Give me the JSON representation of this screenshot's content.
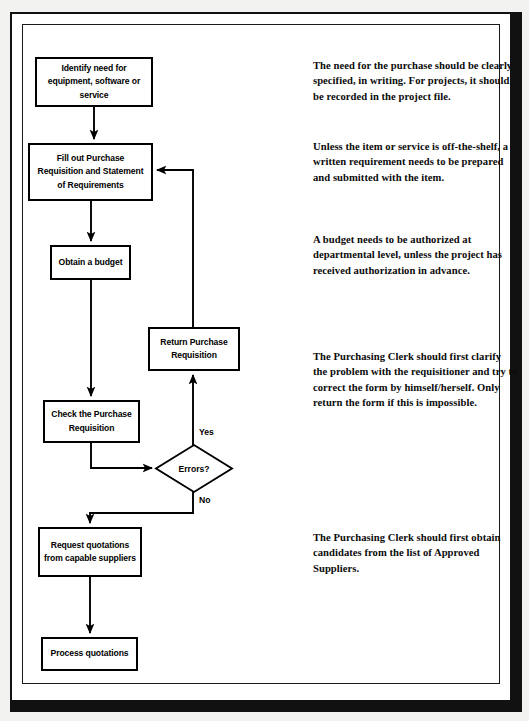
{
  "document": {
    "title": "Purchasing Process Flowchart",
    "frame_color": "#111111",
    "page_color": "#ffffff",
    "ink_color": "#000000"
  },
  "flowchart": {
    "type": "process-flow",
    "nodes": [
      {
        "id": "identify-need",
        "shape": "process",
        "label": "Identify need for equipment, software or service",
        "x": 35,
        "y": 57,
        "w": 118,
        "h": 50
      },
      {
        "id": "fill-out-requisition",
        "shape": "process",
        "label": "Fill out Purchase Requisition and Statement of Requirements",
        "x": 28,
        "y": 143,
        "w": 125,
        "h": 58
      },
      {
        "id": "obtain-budget",
        "shape": "process",
        "label": "Obtain a budget",
        "x": 50,
        "y": 245,
        "w": 81,
        "h": 35
      },
      {
        "id": "return-requisition",
        "shape": "process",
        "label": "Return Purchase Requisition",
        "x": 148,
        "y": 327,
        "w": 92,
        "h": 44
      },
      {
        "id": "check-requisition",
        "shape": "process",
        "label": "Check the Purchase Requisition",
        "x": 43,
        "y": 400,
        "w": 97,
        "h": 43
      },
      {
        "id": "errors-decision",
        "shape": "decision",
        "label": "Errors?",
        "x": 156,
        "y": 445,
        "w": 76,
        "h": 47
      },
      {
        "id": "request-quotations",
        "shape": "process",
        "label": "Request quotations from capable suppliers",
        "x": 38,
        "y": 527,
        "w": 104,
        "h": 50
      },
      {
        "id": "process-quotations",
        "shape": "process",
        "label": "Process quotations",
        "x": 41,
        "y": 637,
        "w": 97,
        "h": 34
      }
    ],
    "branch_labels": [
      {
        "id": "yes-label",
        "text": "Yes",
        "x": 199,
        "y": 427
      },
      {
        "id": "no-label",
        "text": "No",
        "x": 199,
        "y": 495
      }
    ],
    "edges": [
      {
        "id": "edge-identify-to-fill",
        "from": "identify-need",
        "to": "fill-out-requisition",
        "label": ""
      },
      {
        "id": "edge-fill-to-budget",
        "from": "fill-out-requisition",
        "to": "obtain-budget",
        "label": ""
      },
      {
        "id": "edge-budget-to-check",
        "from": "obtain-budget",
        "to": "check-requisition",
        "label": ""
      },
      {
        "id": "edge-check-to-errors",
        "from": "check-requisition",
        "to": "errors-decision",
        "label": ""
      },
      {
        "id": "edge-errors-yes-to-return",
        "from": "errors-decision",
        "to": "return-requisition",
        "label": "Yes"
      },
      {
        "id": "edge-return-to-fill",
        "from": "return-requisition",
        "to": "fill-out-requisition",
        "label": ""
      },
      {
        "id": "edge-errors-no-to-quotations",
        "from": "errors-decision",
        "to": "request-quotations",
        "label": "No"
      },
      {
        "id": "edge-quotations-to-process",
        "from": "request-quotations",
        "to": "process-quotations",
        "label": ""
      }
    ]
  },
  "notes": [
    {
      "id": "note-need",
      "text": "The need for the purchase should be clearly specified, in writing. For projects, it should be recorded in the project file.",
      "x": 313,
      "y": 58
    },
    {
      "id": "note-requirement",
      "text": "Unless the item or service is off-the-shelf, a written requirement needs to be prepared and submitted with the item.",
      "x": 313,
      "y": 139
    },
    {
      "id": "note-budget",
      "text": "A budget needs to be authorized at departmental level, unless the project has received authorization in advance.",
      "x": 313,
      "y": 232
    },
    {
      "id": "note-clerk-clarify",
      "text": "The Purchasing Clerk should first clarify the problem with the requisitioner and try to correct the form by himself/herself.  Only return the form if this is impossible.",
      "x": 313,
      "y": 349
    },
    {
      "id": "note-clerk-suppliers",
      "text": "The Purchasing Clerk should first obtain candidates from the list of Approved Suppliers.",
      "x": 313,
      "y": 530
    }
  ]
}
